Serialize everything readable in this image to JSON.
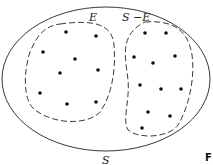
{
  "diagram": {
    "type": "set-partition-venn",
    "universe_label": "S",
    "subsets": [
      {
        "name": "E",
        "label": "E",
        "point_count": 9
      },
      {
        "name": "S-E",
        "label": "S −E",
        "point_count": 11
      }
    ],
    "corner_label": "F",
    "colors": {
      "stroke": "#222222",
      "background": "#ffffff"
    }
  }
}
